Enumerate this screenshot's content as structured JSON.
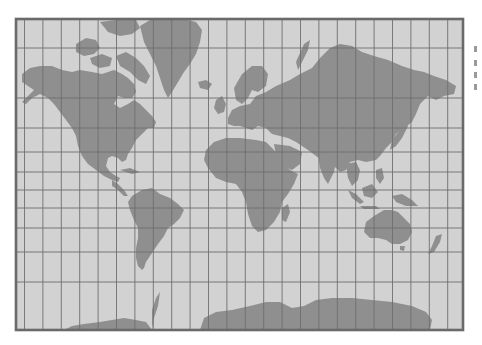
{
  "map": {
    "projection": "Mercator",
    "title": "World map (Mercator projection)",
    "grid": {
      "meridians": 24,
      "meridian_spacing_deg": 15,
      "parallels_visible": 10
    },
    "colors": {
      "ocean": "#d2d2d2",
      "land": "#8f8f8f",
      "grid": "#6e6e6e",
      "frame": "#6a6a6a",
      "page": "#ffffff"
    },
    "frame": {
      "x": 16,
      "y": 19,
      "width": 447,
      "height": 311
    },
    "landmasses": [
      "North America",
      "Greenland",
      "South America",
      "Europe",
      "Africa",
      "Asia",
      "Australia",
      "New Zealand",
      "Antarctica",
      "Madagascar",
      "Japan",
      "Indonesia",
      "British Isles",
      "Arctic Archipelago"
    ]
  }
}
